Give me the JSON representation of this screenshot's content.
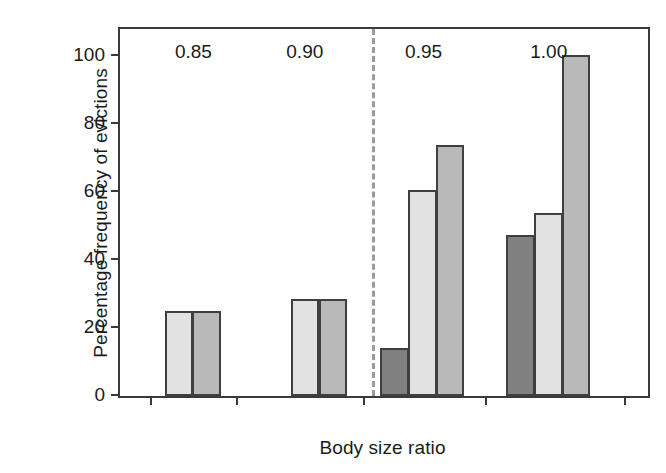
{
  "chart_data": {
    "type": "bar",
    "title": "",
    "subtitle": "",
    "xlabel": "Body size ratio",
    "ylabel": "Percentage frequency of evictions",
    "categories": [
      "0.85",
      "0.90",
      "0.95",
      "1.00"
    ],
    "xtick_labels": [
      "0.85",
      "0.90",
      "0.95",
      "1.00"
    ],
    "ytick_labels": [
      "0",
      "20",
      "40",
      "60",
      "80",
      "100"
    ],
    "ytick_values": [
      0,
      20,
      40,
      60,
      80,
      100
    ],
    "ylim": [
      0,
      108
    ],
    "xlim_note": "categorical, grouped bars",
    "grid": false,
    "legend": "none",
    "series": [
      {
        "name": "series-1",
        "color": "#808080",
        "values": [
          null,
          null,
          14,
          47.5
        ]
      },
      {
        "name": "series-2",
        "color": "#e2e2e2",
        "values": [
          25,
          28.5,
          60.5,
          54
        ]
      },
      {
        "name": "series-3",
        "color": "#b9b9b9",
        "values": [
          25,
          28.5,
          74,
          100.5
        ]
      }
    ],
    "annotations": [
      {
        "name": "vertical-dashed-divider",
        "type": "vline",
        "between_categories": [
          "0.90",
          "0.95"
        ],
        "x_fraction": 0.477,
        "style": "dashed",
        "color": "#9a9a9a"
      }
    ],
    "axes": {
      "frame": "full box",
      "axis_color": "#3a3a3a",
      "tick_direction": "out"
    }
  },
  "bars": [
    {
      "name": "bar-085-light",
      "group": "0.85",
      "series": "series-2",
      "value": 25,
      "color": "#e2e2e2",
      "left_pct": 8.45,
      "width_pct": 5.45
    },
    {
      "name": "bar-085-medium",
      "group": "0.85",
      "series": "series-3",
      "value": 25,
      "color": "#b9b9b9",
      "left_pct": 13.72,
      "width_pct": 5.45
    },
    {
      "name": "bar-090-light",
      "group": "0.90",
      "series": "series-2",
      "value": 28.5,
      "color": "#e2e2e2",
      "left_pct": 32.33,
      "width_pct": 5.45
    },
    {
      "name": "bar-090-medium",
      "group": "0.90",
      "series": "series-3",
      "value": 28.5,
      "color": "#b9b9b9",
      "left_pct": 37.6,
      "width_pct": 5.45
    },
    {
      "name": "bar-095-dark",
      "group": "0.95",
      "series": "series-1",
      "value": 14,
      "color": "#808080",
      "left_pct": 49.25,
      "width_pct": 5.45
    },
    {
      "name": "bar-095-light",
      "group": "0.95",
      "series": "series-2",
      "value": 60.5,
      "color": "#e2e2e2",
      "left_pct": 54.51,
      "width_pct": 5.45
    },
    {
      "name": "bar-095-medium",
      "group": "0.95",
      "series": "series-3",
      "value": 74,
      "color": "#b9b9b9",
      "left_pct": 59.77,
      "width_pct": 5.45
    },
    {
      "name": "bar-100-dark",
      "group": "1.00",
      "series": "series-1",
      "value": 47.5,
      "color": "#808080",
      "left_pct": 73.12,
      "width_pct": 5.45
    },
    {
      "name": "bar-100-light",
      "group": "1.00",
      "series": "series-2",
      "value": 54,
      "color": "#e2e2e2",
      "left_pct": 78.38,
      "width_pct": 5.45
    },
    {
      "name": "bar-100-medium",
      "group": "1.00",
      "series": "series-3",
      "value": 100.5,
      "color": "#b9b9b9",
      "left_pct": 83.65,
      "width_pct": 5.45
    }
  ],
  "xticks": [
    {
      "label": "0.85",
      "pos_pct": 5.6
    },
    {
      "label": "0.85",
      "pos_pct": 22.0
    },
    {
      "label": "0.90",
      "pos_pct": 46.0
    },
    {
      "label": "0.95",
      "pos_pct": 69.2
    },
    {
      "label": "1.00",
      "pos_pct": 95.5
    }
  ],
  "xtick_positions_pct": [
    5.6,
    22.0,
    46.0,
    69.2,
    95.5
  ],
  "xlabel_positions_pct": [
    13.9,
    35.0,
    57.5,
    81.2
  ],
  "divider_pos_pct": 47.7
}
